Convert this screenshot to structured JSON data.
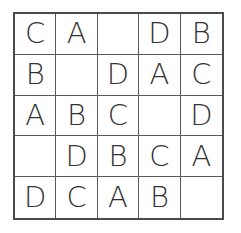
{
  "puzzle": {
    "type": "latin-square-letter-grid",
    "size": 5,
    "rows": [
      [
        "C",
        "A",
        "",
        "D",
        "B"
      ],
      [
        "B",
        "",
        "D",
        "A",
        "C"
      ],
      [
        "A",
        "B",
        "C",
        "",
        "D"
      ],
      [
        "",
        "D",
        "B",
        "C",
        "A"
      ],
      [
        "D",
        "C",
        "A",
        "B",
        ""
      ]
    ]
  },
  "colors": {
    "grid_line": "#4a4a4a",
    "text": "#333333",
    "background": "#ffffff"
  }
}
